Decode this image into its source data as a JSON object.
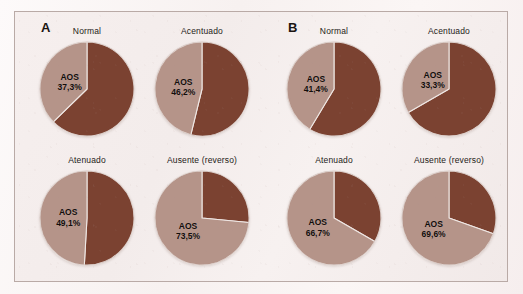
{
  "figure": {
    "colors": {
      "aos_slice": "#b59489",
      "other_slice": "#7b4231",
      "slice_divider": "#efe7e4",
      "frame_border": "#b9aaa6",
      "background": "#f4eded",
      "text": "#1b1512"
    },
    "panels": [
      {
        "id": "A",
        "letter": "A",
        "charts": [
          {
            "id": "a-normal",
            "title": "Normal",
            "label_name": "AOS",
            "label_value": "37,3%",
            "aos_percent": 37.3,
            "other_percent": 62.7,
            "position": "top-left"
          },
          {
            "id": "a-acentuado",
            "title": "Acentuado",
            "label_name": "AOS",
            "label_value": "46,2%",
            "aos_percent": 46.2,
            "other_percent": 53.8,
            "position": "top-right"
          },
          {
            "id": "a-atenuado",
            "title": "Atenuado",
            "label_name": "AOS",
            "label_value": "49,1%",
            "aos_percent": 49.1,
            "other_percent": 50.9,
            "position": "bottom-left"
          },
          {
            "id": "a-ausente",
            "title": "Ausente (reverso)",
            "label_name": "AOS",
            "label_value": "73,5%",
            "aos_percent": 73.5,
            "other_percent": 26.5,
            "position": "bottom-right"
          }
        ]
      },
      {
        "id": "B",
        "letter": "B",
        "charts": [
          {
            "id": "b-normal",
            "title": "Normal",
            "label_name": "AOS",
            "label_value": "41,4%",
            "aos_percent": 41.4,
            "other_percent": 58.6,
            "position": "top-left"
          },
          {
            "id": "b-acentuado",
            "title": "Acentuado",
            "label_name": "AOS",
            "label_value": "33,3%",
            "aos_percent": 33.3,
            "other_percent": 66.7,
            "position": "top-right"
          },
          {
            "id": "b-atenuado",
            "title": "Atenuado",
            "label_name": "AOS",
            "label_value": "66,7%",
            "aos_percent": 66.7,
            "other_percent": 33.3,
            "position": "bottom-left"
          },
          {
            "id": "b-ausente",
            "title": "Ausente (reverso)",
            "label_name": "AOS",
            "label_value": "69,6%",
            "aos_percent": 69.6,
            "other_percent": 30.4,
            "position": "bottom-right"
          }
        ]
      }
    ]
  },
  "chart_data": [
    {
      "type": "pie",
      "title": "Normal",
      "panel": "A",
      "categories": [
        "AOS",
        "Nao AOS"
      ],
      "values": [
        37.3,
        62.7
      ],
      "data_labels": [
        "AOS 37,3%"
      ],
      "legend": "none",
      "colors": [
        "#b59489",
        "#7b4231"
      ]
    },
    {
      "type": "pie",
      "title": "Acentuado",
      "panel": "A",
      "categories": [
        "AOS",
        "Nao AOS"
      ],
      "values": [
        46.2,
        53.8
      ],
      "data_labels": [
        "AOS 46,2%"
      ],
      "legend": "none",
      "colors": [
        "#b59489",
        "#7b4231"
      ]
    },
    {
      "type": "pie",
      "title": "Atenuado",
      "panel": "A",
      "categories": [
        "AOS",
        "Nao AOS"
      ],
      "values": [
        49.1,
        50.9
      ],
      "data_labels": [
        "AOS 49,1%"
      ],
      "legend": "none",
      "colors": [
        "#b59489",
        "#7b4231"
      ]
    },
    {
      "type": "pie",
      "title": "Ausente (reverso)",
      "panel": "A",
      "categories": [
        "AOS",
        "Nao AOS"
      ],
      "values": [
        73.5,
        26.5
      ],
      "data_labels": [
        "AOS 73,5%"
      ],
      "legend": "none",
      "colors": [
        "#b59489",
        "#7b4231"
      ]
    },
    {
      "type": "pie",
      "title": "Normal",
      "panel": "B",
      "categories": [
        "AOS",
        "Nao AOS"
      ],
      "values": [
        41.4,
        58.6
      ],
      "data_labels": [
        "AOS 41,4%"
      ],
      "legend": "none",
      "colors": [
        "#b59489",
        "#7b4231"
      ]
    },
    {
      "type": "pie",
      "title": "Acentuado",
      "panel": "B",
      "categories": [
        "AOS",
        "Nao AOS"
      ],
      "values": [
        33.3,
        66.7
      ],
      "data_labels": [
        "AOS 33,3%"
      ],
      "legend": "none",
      "colors": [
        "#b59489",
        "#7b4231"
      ]
    },
    {
      "type": "pie",
      "title": "Atenuado",
      "panel": "B",
      "categories": [
        "AOS",
        "Nao AOS"
      ],
      "values": [
        66.7,
        33.3
      ],
      "data_labels": [
        "AOS 66,7%"
      ],
      "legend": "none",
      "colors": [
        "#b59489",
        "#7b4231"
      ]
    },
    {
      "type": "pie",
      "title": "Ausente (reverso)",
      "panel": "B",
      "categories": [
        "AOS",
        "Nao AOS"
      ],
      "values": [
        69.6,
        30.4
      ],
      "data_labels": [
        "AOS 69,6%"
      ],
      "legend": "none",
      "colors": [
        "#b59489",
        "#7b4231"
      ]
    }
  ]
}
